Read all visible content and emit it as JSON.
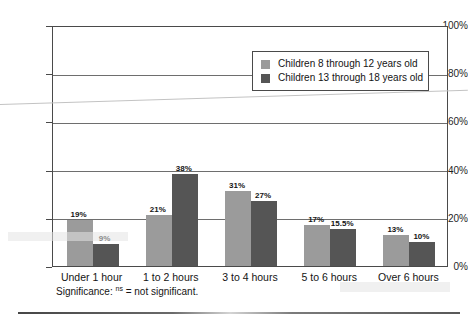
{
  "chart_data": {
    "type": "bar",
    "title": "",
    "subtitle": "",
    "xlabel": "",
    "ylabel": "",
    "ylim": [
      0,
      100
    ],
    "yticks": [
      "0%",
      "20%",
      "40%",
      "60%",
      "80%",
      "100%"
    ],
    "ytick_values": [
      0,
      20,
      40,
      60,
      80,
      100
    ],
    "grid": true,
    "legend_position": "upper-right",
    "categories": [
      "Under 1 hour",
      "1 to 2 hours",
      "3 to 4 hours",
      "5 to 6 hours",
      "Over 6 hours"
    ],
    "series": [
      {
        "name": "Children 8 through 12 years old",
        "color": "#9b9b9b",
        "values": [
          19,
          21,
          31,
          17,
          13
        ],
        "labels": [
          "19%",
          "21%",
          "31%",
          "17%",
          "13%"
        ]
      },
      {
        "name": "Children 13 through 18 years old",
        "color": "#555555",
        "values": [
          9,
          38,
          27,
          15.5,
          10
        ],
        "labels": [
          "9%",
          "38%",
          "27%",
          "15.5%",
          "10%"
        ]
      }
    ],
    "annotations": [
      "Significance: ns = not significant."
    ]
  },
  "legend": {
    "items": [
      {
        "label": "Children 8 through 12 years old",
        "color": "#9b9b9b"
      },
      {
        "label": "Children 13 through 18 years old",
        "color": "#555555"
      }
    ]
  },
  "footnote": {
    "prefix": "Significance: ",
    "marker": "ns",
    "suffix": " = not significant."
  },
  "colors": {
    "series_light": "#9b9b9b",
    "series_dark": "#555555",
    "axis": "#4a4a4a",
    "grid": "#6e6e6e",
    "text": "#141414"
  }
}
